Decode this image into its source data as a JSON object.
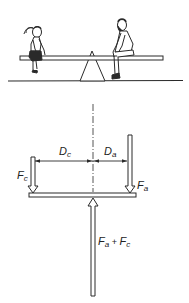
{
  "scene": {
    "description": "Seesaw with a child on the left and an adult on the right, balanced over a triangular fulcrum",
    "figures": [
      "child",
      "adult"
    ]
  },
  "diagram": {
    "labels": {
      "force_child": {
        "main": "F",
        "sub": "c"
      },
      "force_adult": {
        "main": "F",
        "sub": "a"
      },
      "distance_child": {
        "main": "D",
        "sub": "c"
      },
      "distance_adult": {
        "main": "D",
        "sub": "a"
      },
      "reaction_force": {
        "a_main": "F",
        "a_sub": "a",
        "plus": " + ",
        "c_main": "F",
        "c_sub": "c"
      }
    },
    "colors": {
      "ink": "#2a2a2a",
      "background": "#ffffff"
    }
  }
}
